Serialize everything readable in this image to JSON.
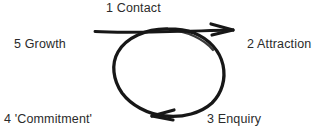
{
  "diagram": {
    "background_color": "#ffffff",
    "ink_color": "#171717",
    "text_color": "#2b2b2b",
    "stages": [
      {
        "id": "contact",
        "number": "1",
        "name": "Contact",
        "label": "1 Contact"
      },
      {
        "id": "attraction",
        "number": "2",
        "name": "Attraction",
        "label": "2 Attraction"
      },
      {
        "id": "enquiry",
        "number": "3",
        "name": "Enquiry",
        "label": "3 Enquiry"
      },
      {
        "id": "commitment",
        "number": "4",
        "name": "'Commitment'",
        "label": "4 'Commitment'"
      },
      {
        "id": "growth",
        "number": "5",
        "name": "Growth",
        "label": "5 Growth"
      }
    ],
    "shapes": {
      "loop": "hand-drawn-ellipse",
      "loop_direction": "clockwise",
      "straight_line": "horizontal-line-with-right-arrowhead",
      "arrowheads": [
        "right-arrowhead-top",
        "left-arrowhead-bottom"
      ]
    }
  }
}
